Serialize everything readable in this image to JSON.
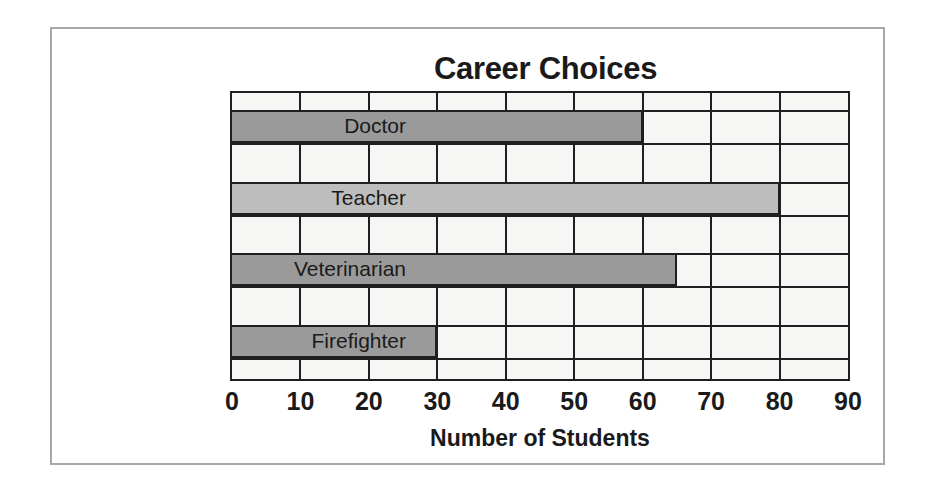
{
  "figure": {
    "title": "Career Choices",
    "frame_color": "#a8a8a8",
    "plot_background": "#f6f6f4",
    "axis_color": "#1f1f1f"
  },
  "chart_data": {
    "type": "bar",
    "orientation": "horizontal",
    "title": "Career Choices",
    "xlabel": "Number of Students",
    "ylabel": "",
    "categories": [
      "Doctor",
      "Teacher",
      "Veterinarian",
      "Firefighter"
    ],
    "values": [
      60,
      80,
      65,
      30
    ],
    "bar_colors": [
      "#9a9a9a",
      "#bdbdbd",
      "#9a9a9a",
      "#9a9a9a"
    ],
    "xlim": [
      0,
      90
    ],
    "xticks": [
      0,
      10,
      20,
      30,
      40,
      50,
      60,
      70,
      80,
      90
    ],
    "xtick_labels": [
      "0",
      "10",
      "20",
      "30",
      "40",
      "50",
      "60",
      "70",
      "80",
      "90"
    ],
    "grid": true,
    "grid_axis": "x",
    "legend": false
  }
}
